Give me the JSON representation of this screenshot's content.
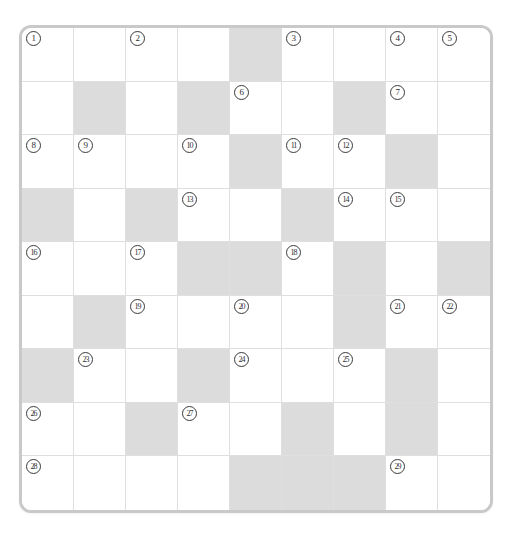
{
  "puzzle": {
    "type": "crossword-grid",
    "title": "",
    "columns": 9,
    "rows": 9,
    "colors": {
      "blank_cell": "#ffffff",
      "shaded_cell": "#dcdcdc",
      "grid_line": "#dfdfdf",
      "frame_border": "#c9c9c9",
      "number_text": "#2e2e2e"
    },
    "clue_number_style": "circled",
    "total_clue_numbers": 29,
    "grid": [
      [
        {
          "shaded": false,
          "number": "1"
        },
        {
          "shaded": false,
          "number": ""
        },
        {
          "shaded": false,
          "number": "2"
        },
        {
          "shaded": false,
          "number": ""
        },
        {
          "shaded": true,
          "number": ""
        },
        {
          "shaded": false,
          "number": "3"
        },
        {
          "shaded": false,
          "number": ""
        },
        {
          "shaded": false,
          "number": "4"
        },
        {
          "shaded": false,
          "number": "5"
        }
      ],
      [
        {
          "shaded": false,
          "number": ""
        },
        {
          "shaded": true,
          "number": ""
        },
        {
          "shaded": false,
          "number": ""
        },
        {
          "shaded": true,
          "number": ""
        },
        {
          "shaded": false,
          "number": "6"
        },
        {
          "shaded": false,
          "number": ""
        },
        {
          "shaded": true,
          "number": ""
        },
        {
          "shaded": false,
          "number": "7"
        },
        {
          "shaded": false,
          "number": ""
        }
      ],
      [
        {
          "shaded": false,
          "number": "8"
        },
        {
          "shaded": false,
          "number": "9"
        },
        {
          "shaded": false,
          "number": ""
        },
        {
          "shaded": false,
          "number": "10"
        },
        {
          "shaded": true,
          "number": ""
        },
        {
          "shaded": false,
          "number": "11"
        },
        {
          "shaded": false,
          "number": "12"
        },
        {
          "shaded": true,
          "number": ""
        },
        {
          "shaded": false,
          "number": ""
        }
      ],
      [
        {
          "shaded": true,
          "number": ""
        },
        {
          "shaded": false,
          "number": ""
        },
        {
          "shaded": true,
          "number": ""
        },
        {
          "shaded": false,
          "number": "13"
        },
        {
          "shaded": false,
          "number": ""
        },
        {
          "shaded": true,
          "number": ""
        },
        {
          "shaded": false,
          "number": "14"
        },
        {
          "shaded": false,
          "number": "15"
        },
        {
          "shaded": false,
          "number": ""
        }
      ],
      [
        {
          "shaded": false,
          "number": "16"
        },
        {
          "shaded": false,
          "number": ""
        },
        {
          "shaded": false,
          "number": "17"
        },
        {
          "shaded": true,
          "number": ""
        },
        {
          "shaded": true,
          "number": ""
        },
        {
          "shaded": false,
          "number": "18"
        },
        {
          "shaded": true,
          "number": ""
        },
        {
          "shaded": false,
          "number": ""
        },
        {
          "shaded": true,
          "number": ""
        }
      ],
      [
        {
          "shaded": false,
          "number": ""
        },
        {
          "shaded": true,
          "number": ""
        },
        {
          "shaded": false,
          "number": "19"
        },
        {
          "shaded": false,
          "number": ""
        },
        {
          "shaded": false,
          "number": "20"
        },
        {
          "shaded": false,
          "number": ""
        },
        {
          "shaded": true,
          "number": ""
        },
        {
          "shaded": false,
          "number": "21"
        },
        {
          "shaded": false,
          "number": "22"
        }
      ],
      [
        {
          "shaded": true,
          "number": ""
        },
        {
          "shaded": false,
          "number": "23"
        },
        {
          "shaded": false,
          "number": ""
        },
        {
          "shaded": true,
          "number": ""
        },
        {
          "shaded": false,
          "number": "24"
        },
        {
          "shaded": false,
          "number": ""
        },
        {
          "shaded": false,
          "number": "25"
        },
        {
          "shaded": true,
          "number": ""
        },
        {
          "shaded": false,
          "number": ""
        }
      ],
      [
        {
          "shaded": false,
          "number": "26"
        },
        {
          "shaded": false,
          "number": ""
        },
        {
          "shaded": true,
          "number": ""
        },
        {
          "shaded": false,
          "number": "27"
        },
        {
          "shaded": false,
          "number": ""
        },
        {
          "shaded": true,
          "number": ""
        },
        {
          "shaded": false,
          "number": ""
        },
        {
          "shaded": true,
          "number": ""
        },
        {
          "shaded": false,
          "number": ""
        }
      ],
      [
        {
          "shaded": false,
          "number": "28"
        },
        {
          "shaded": false,
          "number": ""
        },
        {
          "shaded": false,
          "number": ""
        },
        {
          "shaded": false,
          "number": ""
        },
        {
          "shaded": true,
          "number": ""
        },
        {
          "shaded": true,
          "number": ""
        },
        {
          "shaded": true,
          "number": ""
        },
        {
          "shaded": false,
          "number": "29"
        },
        {
          "shaded": false,
          "number": ""
        }
      ]
    ]
  }
}
